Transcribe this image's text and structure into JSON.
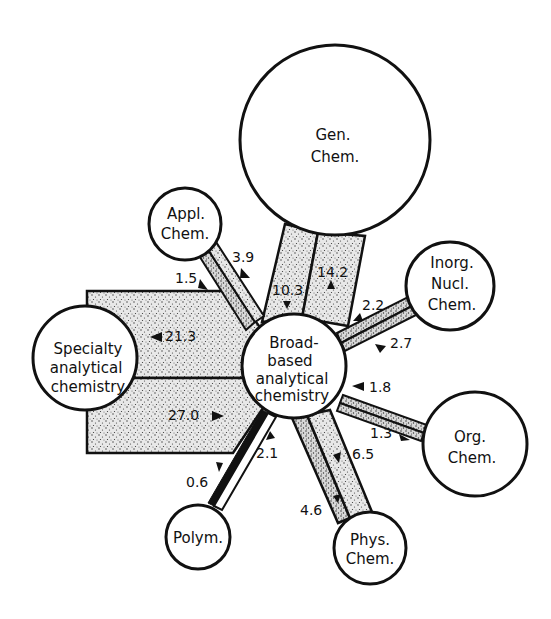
{
  "diagram": {
    "type": "citation-flow-network",
    "center_node": "broad",
    "nodes": [
      {
        "id": "gen",
        "lines": [
          "Gen.",
          "Chem."
        ],
        "cx": 335,
        "cy": 140,
        "r": 95
      },
      {
        "id": "appl",
        "lines": [
          "Appl.",
          "Chem."
        ],
        "cx": 185,
        "cy": 224,
        "r": 36
      },
      {
        "id": "inorg",
        "lines": [
          "Inorg.",
          "Nucl.",
          "Chem."
        ],
        "cx": 450,
        "cy": 286,
        "r": 44
      },
      {
        "id": "broad",
        "lines": [
          "Broad-",
          "based",
          "analytical",
          "chemistry"
        ],
        "cx": 294,
        "cy": 366,
        "r": 52
      },
      {
        "id": "specialty",
        "lines": [
          "Specialty",
          "analytical",
          "chemistry"
        ],
        "cx": 85,
        "cy": 358,
        "r": 52
      },
      {
        "id": "org",
        "lines": [
          "Org.",
          "Chem."
        ],
        "cx": 475,
        "cy": 444,
        "r": 52
      },
      {
        "id": "phys",
        "lines": [
          "Phys.",
          "Chem."
        ],
        "cx": 370,
        "cy": 548,
        "r": 36
      },
      {
        "id": "polym",
        "lines": [
          "Polym."
        ],
        "cx": 198,
        "cy": 537,
        "r": 32
      }
    ],
    "flows": [
      {
        "from": "broad",
        "to": "gen",
        "value": "10.3"
      },
      {
        "from": "gen",
        "to": "broad",
        "value": "14.2"
      },
      {
        "from": "broad",
        "to": "appl",
        "value": "1.5"
      },
      {
        "from": "appl",
        "to": "broad",
        "value": "3.9"
      },
      {
        "from": "inorg",
        "to": "broad",
        "value": "2.2"
      },
      {
        "from": "broad",
        "to": "inorg",
        "value": "2.7"
      },
      {
        "from": "broad",
        "to": "specialty",
        "value": "21.3"
      },
      {
        "from": "specialty",
        "to": "broad",
        "value": "27.0"
      },
      {
        "from": "org",
        "to": "broad",
        "value": "1.8"
      },
      {
        "from": "broad",
        "to": "org",
        "value": "1.3"
      },
      {
        "from": "broad",
        "to": "phys",
        "value": "6.5"
      },
      {
        "from": "phys",
        "to": "broad",
        "value": "4.6"
      },
      {
        "from": "broad",
        "to": "polym",
        "value": "2.1"
      },
      {
        "from": "polym",
        "to": "broad",
        "value": "0.6"
      }
    ]
  },
  "labels": {
    "gen": {
      "l1": "Gen.",
      "l2": "Chem."
    },
    "appl": {
      "l1": "Appl.",
      "l2": "Chem."
    },
    "inorg": {
      "l1": "Inorg.",
      "l2": "Nucl.",
      "l3": "Chem."
    },
    "broad": {
      "l1": "Broad-",
      "l2": "based",
      "l3": "analytical",
      "l4": "chemistry"
    },
    "specialty": {
      "l1": "Specialty",
      "l2": "analytical",
      "l3": "chemistry"
    },
    "org": {
      "l1": "Org.",
      "l2": "Chem."
    },
    "phys": {
      "l1": "Phys.",
      "l2": "Chem."
    },
    "polym": {
      "l1": "Polym."
    }
  },
  "values": {
    "gen_in": "10.3",
    "gen_out": "14.2",
    "appl_in": "1.5",
    "appl_out": "3.9",
    "inorg_out": "2.2",
    "inorg_in": "2.7",
    "spec_in": "21.3",
    "spec_out": "27.0",
    "org_out": "1.8",
    "org_in": "1.3",
    "phys_in": "6.5",
    "phys_out": "4.6",
    "polym_in": "2.1",
    "polym_out": "0.6"
  },
  "colors": {
    "stroke": "#111111",
    "background": "#ffffff",
    "stipple_bg": "#e6e6e6",
    "stipple_dot": "#333333"
  }
}
